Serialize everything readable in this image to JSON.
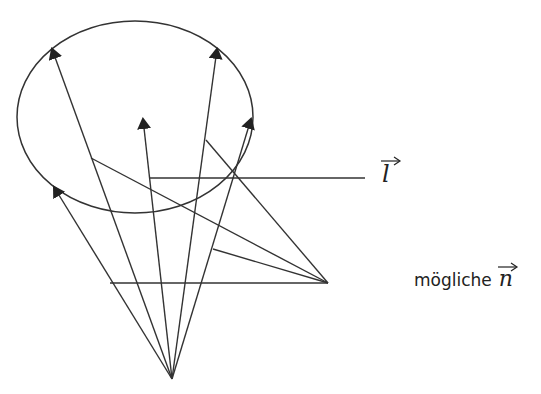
{
  "labels": {
    "light_vector": "l",
    "normals_caption": "mögliche",
    "normal_vector": "n"
  },
  "diagram": {
    "stroke_color": "#333333",
    "ellipse": {
      "cx": 135,
      "cy": 117,
      "rx": 118,
      "ry": 96
    },
    "origin": {
      "x": 172,
      "y": 379
    },
    "target_point": {
      "x": 328,
      "y": 283
    },
    "arrows": [
      {
        "to": {
          "x": 54,
          "y": 187
        }
      },
      {
        "to": {
          "x": 52,
          "y": 49
        }
      },
      {
        "to": {
          "x": 143,
          "y": 119
        }
      },
      {
        "to": {
          "x": 217,
          "y": 49
        }
      },
      {
        "to": {
          "x": 251,
          "y": 119
        }
      }
    ],
    "lines": [
      {
        "from": {
          "x": 149,
          "y": 178
        },
        "to": {
          "x": 365,
          "y": 178
        }
      },
      {
        "from": {
          "x": 110,
          "y": 283
        },
        "to": {
          "x": 328,
          "y": 283
        }
      },
      {
        "from": {
          "x": 91,
          "y": 158
        },
        "to": {
          "x": 328,
          "y": 283
        }
      },
      {
        "from": {
          "x": 206,
          "y": 140
        },
        "to": {
          "x": 328,
          "y": 283
        }
      },
      {
        "from": {
          "x": 213,
          "y": 249
        },
        "to": {
          "x": 328,
          "y": 283
        }
      }
    ]
  }
}
